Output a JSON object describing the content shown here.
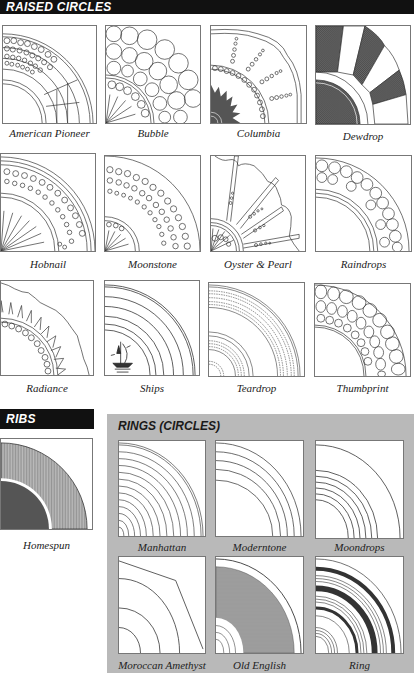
{
  "sections": {
    "raised_circles": {
      "title": "RAISED CIRCLES",
      "patterns": [
        {
          "name": "American Pioneer",
          "icon": "american-pioneer-pattern"
        },
        {
          "name": "Bubble",
          "icon": "bubble-pattern"
        },
        {
          "name": "Columbia",
          "icon": "columbia-pattern"
        },
        {
          "name": "Dewdrop",
          "icon": "dewdrop-pattern"
        },
        {
          "name": "Hobnail",
          "icon": "hobnail-pattern"
        },
        {
          "name": "Moonstone",
          "icon": "moonstone-pattern"
        },
        {
          "name": "Oyster & Pearl",
          "icon": "oyster-pearl-pattern"
        },
        {
          "name": "Raindrops",
          "icon": "raindrops-pattern"
        },
        {
          "name": "Radiance",
          "icon": "radiance-pattern"
        },
        {
          "name": "Ships",
          "icon": "ships-pattern"
        },
        {
          "name": "Teardrop",
          "icon": "teardrop-pattern"
        },
        {
          "name": "Thumbprint",
          "icon": "thumbprint-pattern"
        }
      ]
    },
    "ribs": {
      "title": "RIBS",
      "patterns": [
        {
          "name": "Homespun",
          "icon": "homespun-pattern"
        }
      ]
    },
    "rings": {
      "title": "RINGS (CIRCLES)",
      "background": "#b9b9b9",
      "patterns": [
        {
          "name": "Manhattan",
          "icon": "manhattan-pattern"
        },
        {
          "name": "Moderntone",
          "icon": "moderntone-pattern"
        },
        {
          "name": "Moondrops",
          "icon": "moondrops-pattern"
        },
        {
          "name": "Moroccan Amethyst",
          "icon": "moroccan-amethyst-pattern"
        },
        {
          "name": "Old English",
          "icon": "old-english-pattern"
        },
        {
          "name": "Ring",
          "icon": "ring-pattern"
        }
      ]
    }
  },
  "colors": {
    "header_bg": "#111111",
    "header_text": "#ffffff",
    "panel_bg": "#b9b9b9",
    "line": "#333333"
  }
}
